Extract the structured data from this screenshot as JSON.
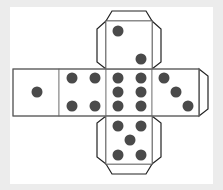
{
  "colors": {
    "background": "#ececec",
    "panel": "#ffffff",
    "outline": "#222222",
    "fold_line": "#888888",
    "pip": "#4a4a4a"
  },
  "diagram": {
    "title": "",
    "type": "dice-net",
    "panel": {
      "x": 10,
      "y": 7,
      "w": 203,
      "h": 177
    },
    "faces": [
      {
        "name": "face-1",
        "value": 1,
        "x": 13,
        "y": 69,
        "w": 46,
        "h": 47,
        "pips": [
          [
            37,
            92
          ]
        ]
      },
      {
        "name": "face-4",
        "value": 4,
        "x": 59,
        "y": 69,
        "w": 47,
        "h": 47,
        "pips": [
          [
            72,
            78
          ],
          [
            95,
            78
          ],
          [
            72,
            106
          ],
          [
            95,
            106
          ]
        ]
      },
      {
        "name": "face-6",
        "value": 6,
        "x": 106,
        "y": 69,
        "w": 46,
        "h": 47,
        "pips": [
          [
            118,
            78
          ],
          [
            141,
            78
          ],
          [
            118,
            92
          ],
          [
            141,
            92
          ],
          [
            118,
            106
          ],
          [
            141,
            106
          ]
        ]
      },
      {
        "name": "face-3",
        "value": 3,
        "x": 152,
        "y": 69,
        "w": 47,
        "h": 47,
        "pips": [
          [
            164,
            78
          ],
          [
            176,
            92
          ],
          [
            188,
            106
          ]
        ]
      },
      {
        "name": "face-2",
        "value": 2,
        "x": 106,
        "y": 21,
        "w": 46,
        "h": 48,
        "pips": [
          [
            118,
            31
          ],
          [
            141,
            59
          ]
        ]
      },
      {
        "name": "face-5",
        "value": 5,
        "x": 106,
        "y": 116,
        "w": 46,
        "h": 48,
        "pips": [
          [
            118,
            126
          ],
          [
            141,
            126
          ],
          [
            130,
            140
          ],
          [
            118,
            155
          ],
          [
            141,
            155
          ]
        ]
      }
    ],
    "tabs": [
      {
        "name": "top-tab",
        "points": "106,21 112,11 146,11 152,21"
      },
      {
        "name": "top-left-tab",
        "points": "106,21 97,29 97,62 106,69"
      },
      {
        "name": "top-right-tab",
        "points": "152,21 161,29 161,62 152,69"
      },
      {
        "name": "right-tab",
        "points": "199,69 208,76 208,109 199,116"
      },
      {
        "name": "bottom-left-tab",
        "points": "106,116 97,123 97,157 106,164"
      },
      {
        "name": "bottom-right-tab",
        "points": "152,116 161,123 161,157 152,164"
      },
      {
        "name": "bottom-tab",
        "points": "106,164 112,174 146,174 152,164"
      }
    ],
    "pip_radius": 5.5
  }
}
